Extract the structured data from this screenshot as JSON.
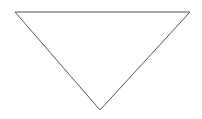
{
  "shape": {
    "type": "triangle",
    "orientation": "pointing-down",
    "points": [
      [
        15,
        12
      ],
      [
        190,
        12
      ],
      [
        100,
        110
      ]
    ],
    "stroke": "#555555",
    "stroke_width": 1,
    "fill": "#ffffff"
  },
  "background": "#ffffff"
}
